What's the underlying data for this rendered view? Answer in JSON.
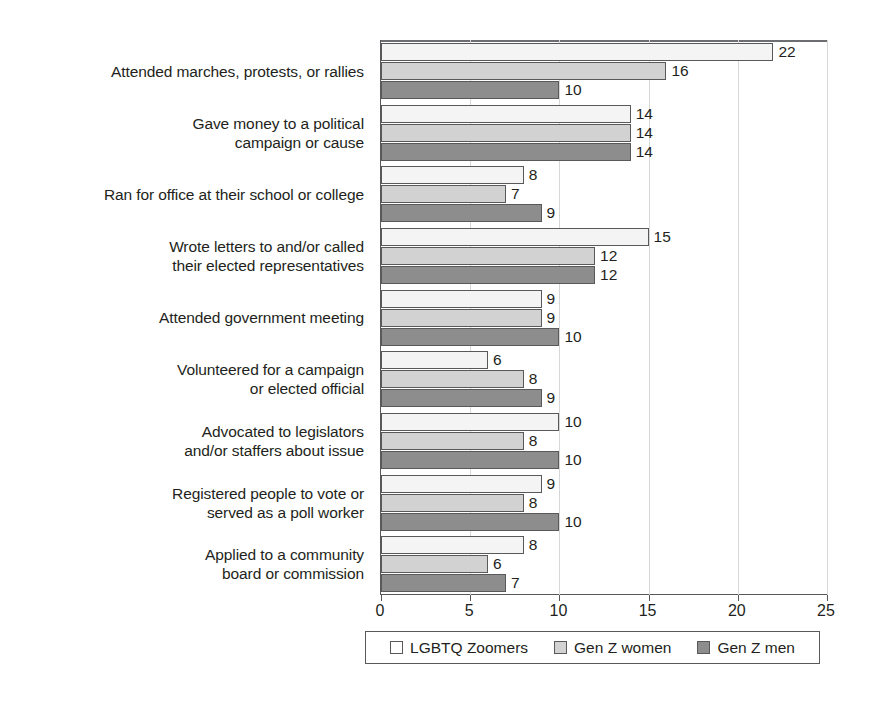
{
  "chart_data": {
    "type": "bar",
    "orientation": "horizontal",
    "title": "",
    "subtitle": "",
    "xlabel": "",
    "ylabel": "",
    "xlim": [
      0,
      25
    ],
    "xticks": [
      0,
      5,
      10,
      15,
      20,
      25
    ],
    "xtick_labels": [
      "0",
      "5",
      "10",
      "15",
      "20",
      "25"
    ],
    "grid": true,
    "grid_axis": "x",
    "legend_position": "bottom",
    "categories": [
      "Attended marches, protests, or rallies",
      "Gave money to a political campaign or cause",
      "Ran for office at their school or college",
      "Wrote letters to and/or called their elected representatives",
      "Attended government meeting",
      "Volunteered for a campaign or elected official",
      "Advocated to legislators and/or staffers about issue",
      "Registered people to vote or served as a poll worker",
      "Applied to a community board or commission"
    ],
    "category_lines": [
      [
        "Attended marches, protests, or rallies"
      ],
      [
        "Gave money to a political",
        "campaign or cause"
      ],
      [
        "Ran for office at their school or college"
      ],
      [
        "Wrote letters to and/or called",
        "their elected representatives"
      ],
      [
        "Attended government meeting"
      ],
      [
        "Volunteered for a campaign",
        "or elected official"
      ],
      [
        "Advocated to legislators",
        "and/or staffers about issue"
      ],
      [
        "Registered people to vote or",
        "served as a poll worker"
      ],
      [
        "Applied to a community",
        "board or commission"
      ]
    ],
    "series": [
      {
        "name": "LGBTQ Zoomers",
        "color": "#f4f4f4",
        "values": [
          22,
          14,
          8,
          15,
          9,
          6,
          10,
          9,
          8
        ]
      },
      {
        "name": "Gen Z women",
        "color": "#d2d2d2",
        "values": [
          16,
          14,
          7,
          12,
          9,
          8,
          8,
          8,
          6
        ]
      },
      {
        "name": "Gen Z men",
        "color": "#8d8d8d",
        "values": [
          10,
          14,
          9,
          12,
          10,
          9,
          10,
          10,
          7
        ]
      }
    ]
  },
  "legend": {
    "items": [
      {
        "label": "LGBTQ Zoomers",
        "swatch": "white-swatch"
      },
      {
        "label": "Gen Z women",
        "swatch": "light-gray-swatch"
      },
      {
        "label": "Gen Z men",
        "swatch": "dark-gray-swatch"
      }
    ]
  },
  "colors": {
    "series_lgbtq_zoomers": "#f4f4f4",
    "series_gen_z_women": "#d2d2d2",
    "series_gen_z_men": "#8d8d8d",
    "axis": "#58595b",
    "grid": "#d7d7d7",
    "text": "#231f20",
    "background": "#ffffff"
  }
}
